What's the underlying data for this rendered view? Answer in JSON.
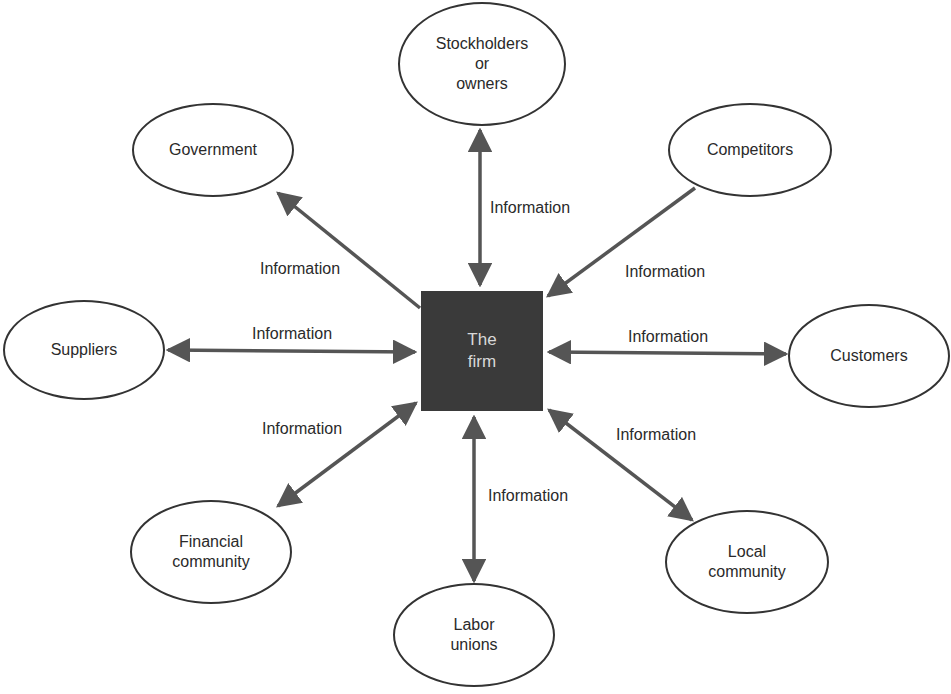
{
  "center": {
    "label": "The\nfirm"
  },
  "nodes": {
    "stockholders": "Stockholders\nor\nowners",
    "government": "Government",
    "competitors": "Competitors",
    "suppliers": "Suppliers",
    "customers": "Customers",
    "financial": "Financial\ncommunity",
    "labor": "Labor\nunions",
    "local": "Local\ncommunity"
  },
  "edge_label": "Information",
  "edges": [
    {
      "to": "Stockholders or owners",
      "label": "Information",
      "direction": "both"
    },
    {
      "to": "Government",
      "label": "Information",
      "direction": "to-node"
    },
    {
      "to": "Competitors",
      "label": "Information",
      "direction": "to-firm"
    },
    {
      "to": "Suppliers",
      "label": "Information",
      "direction": "both"
    },
    {
      "to": "Customers",
      "label": "Information",
      "direction": "both"
    },
    {
      "to": "Financial community",
      "label": "Information",
      "direction": "both"
    },
    {
      "to": "Labor unions",
      "label": "Information",
      "direction": "both"
    },
    {
      "to": "Local community",
      "label": "Information",
      "direction": "both"
    }
  ],
  "colors": {
    "firm_fill": "#3a3a3a",
    "arrow": "#555555",
    "outline": "#333333"
  }
}
